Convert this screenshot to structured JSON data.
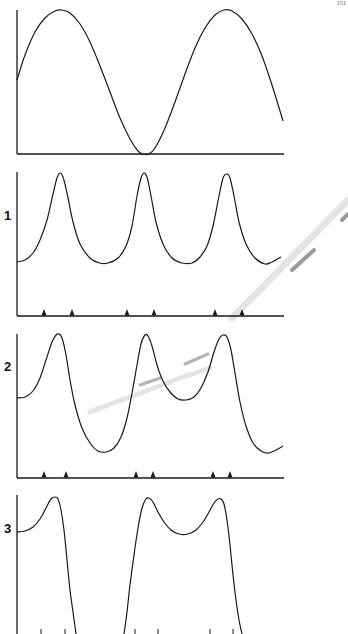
{
  "page": {
    "page_number": "151"
  },
  "figure": {
    "panels": [
      {
        "id": "reference",
        "label": "",
        "description": "sinusoidal stimulus waveform",
        "curve": [
          [
            17,
            80
          ],
          [
            25,
            55
          ],
          [
            35,
            32
          ],
          [
            45,
            18
          ],
          [
            55,
            11
          ],
          [
            62,
            10
          ],
          [
            70,
            13
          ],
          [
            80,
            24
          ],
          [
            90,
            42
          ],
          [
            100,
            66
          ],
          [
            110,
            92
          ],
          [
            120,
            118
          ],
          [
            130,
            139
          ],
          [
            138,
            151
          ],
          [
            143,
            154
          ],
          [
            149,
            154
          ],
          [
            155,
            148
          ],
          [
            165,
            128
          ],
          [
            175,
            102
          ],
          [
            185,
            74
          ],
          [
            195,
            48
          ],
          [
            205,
            28
          ],
          [
            215,
            15
          ],
          [
            224,
            10
          ],
          [
            232,
            11
          ],
          [
            242,
            19
          ],
          [
            252,
            34
          ],
          [
            262,
            56
          ],
          [
            272,
            85
          ],
          [
            283,
            121
          ]
        ],
        "baseline_y": 154,
        "axis_top_y": 10,
        "ticks": []
      },
      {
        "id": "response-1",
        "label": "1",
        "label_y": 208,
        "curve": [
          [
            17,
            262
          ],
          [
            25,
            260
          ],
          [
            33,
            253
          ],
          [
            40,
            240
          ],
          [
            47,
            220
          ],
          [
            53,
            194
          ],
          [
            57,
            178
          ],
          [
            60,
            173
          ],
          [
            63,
            177
          ],
          [
            67,
            193
          ],
          [
            73,
            222
          ],
          [
            80,
            244
          ],
          [
            90,
            258
          ],
          [
            100,
            263
          ],
          [
            108,
            263
          ],
          [
            118,
            258
          ],
          [
            126,
            246
          ],
          [
            132,
            226
          ],
          [
            137,
            196
          ],
          [
            141,
            178
          ],
          [
            144,
            173
          ],
          [
            147,
            177
          ],
          [
            151,
            196
          ],
          [
            156,
            222
          ],
          [
            163,
            244
          ],
          [
            172,
            258
          ],
          [
            182,
            263
          ],
          [
            192,
            263
          ],
          [
            200,
            257
          ],
          [
            207,
            246
          ],
          [
            213,
            226
          ],
          [
            219,
            196
          ],
          [
            223,
            178
          ],
          [
            227,
            174
          ],
          [
            230,
            178
          ],
          [
            234,
            196
          ],
          [
            239,
            222
          ],
          [
            246,
            244
          ],
          [
            255,
            258
          ],
          [
            265,
            264
          ],
          [
            272,
            262
          ],
          [
            281,
            257
          ]
        ],
        "baseline_y": 316,
        "axis_top_y": 172,
        "ticks": [
          44,
          72,
          127,
          154,
          215,
          242
        ]
      },
      {
        "id": "response-2",
        "label": "2",
        "label_y": 359,
        "curve": [
          [
            17,
            398
          ],
          [
            25,
            397
          ],
          [
            33,
            391
          ],
          [
            40,
            378
          ],
          [
            46,
            360
          ],
          [
            52,
            342
          ],
          [
            56,
            335
          ],
          [
            59,
            334
          ],
          [
            62,
            338
          ],
          [
            66,
            355
          ],
          [
            70,
            380
          ],
          [
            75,
            405
          ],
          [
            82,
            428
          ],
          [
            90,
            443
          ],
          [
            98,
            451
          ],
          [
            106,
            452
          ],
          [
            114,
            448
          ],
          [
            121,
            437
          ],
          [
            127,
            418
          ],
          [
            132,
            393
          ],
          [
            137,
            365
          ],
          [
            141,
            344
          ],
          [
            145,
            335
          ],
          [
            148,
            336
          ],
          [
            152,
            346
          ],
          [
            157,
            365
          ],
          [
            163,
            381
          ],
          [
            170,
            392
          ],
          [
            178,
            399
          ],
          [
            186,
            400
          ],
          [
            194,
            397
          ],
          [
            201,
            388
          ],
          [
            208,
            372
          ],
          [
            214,
            352
          ],
          [
            219,
            339
          ],
          [
            223,
            335
          ],
          [
            227,
            337
          ],
          [
            231,
            350
          ],
          [
            235,
            373
          ],
          [
            240,
            402
          ],
          [
            246,
            426
          ],
          [
            253,
            443
          ],
          [
            261,
            451
          ],
          [
            268,
            453
          ],
          [
            276,
            450
          ],
          [
            283,
            446
          ]
        ],
        "baseline_y": 478,
        "axis_top_y": 334,
        "ticks": [
          44,
          66,
          136,
          153,
          213,
          230
        ]
      },
      {
        "id": "response-3",
        "label": "3",
        "label_y": 521,
        "curve": [
          [
            17,
            532
          ],
          [
            25,
            531
          ],
          [
            33,
            527
          ],
          [
            40,
            519
          ],
          [
            46,
            508
          ],
          [
            51,
            499
          ],
          [
            55,
            497
          ],
          [
            58,
            499
          ],
          [
            61,
            510
          ],
          [
            64,
            530
          ],
          [
            67,
            560
          ],
          [
            70,
            590
          ],
          [
            73,
            612
          ],
          [
            76,
            634
          ]
        ],
        "curve2": [
          [
            124,
            634
          ],
          [
            127,
            612
          ],
          [
            130,
            585
          ],
          [
            134,
            555
          ],
          [
            138,
            528
          ],
          [
            142,
            508
          ],
          [
            146,
            499
          ],
          [
            149,
            498
          ],
          [
            153,
            502
          ],
          [
            158,
            512
          ],
          [
            164,
            522
          ],
          [
            171,
            530
          ],
          [
            179,
            534
          ],
          [
            188,
            534
          ],
          [
            196,
            530
          ],
          [
            203,
            522
          ],
          [
            209,
            512
          ],
          [
            214,
            503
          ],
          [
            218,
            499
          ],
          [
            221,
            499
          ],
          [
            224,
            504
          ],
          [
            227,
            520
          ],
          [
            230,
            545
          ],
          [
            233,
            575
          ],
          [
            236,
            600
          ],
          [
            239,
            620
          ],
          [
            242,
            634
          ]
        ],
        "baseline_y": 640,
        "axis_top_y": 495,
        "ticks": [
          41,
          65,
          135,
          158,
          210,
          233
        ]
      }
    ],
    "x_axis_right": 284,
    "axis_left_x": 17,
    "stroke_color": "#1a1a1a",
    "artifact": {
      "type": "pencil-mark",
      "color": "#9a9a9a"
    }
  }
}
